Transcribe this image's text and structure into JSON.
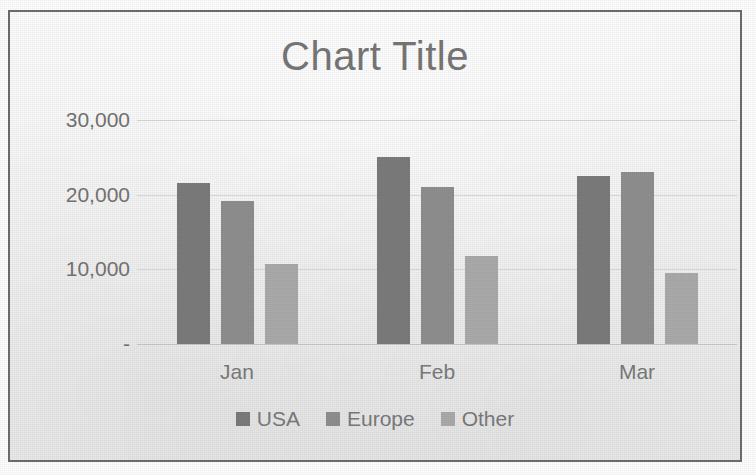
{
  "chart_data": {
    "type": "bar",
    "title": "Chart Title",
    "xlabel": "",
    "ylabel": "",
    "categories": [
      "Jan",
      "Feb",
      "Mar"
    ],
    "series": [
      {
        "name": "USA",
        "values": [
          21500,
          25000,
          22500
        ],
        "color": "#7b7b7b"
      },
      {
        "name": "Europe",
        "values": [
          19200,
          21000,
          23100
        ],
        "color": "#8e8e8e"
      },
      {
        "name": "Other",
        "values": [
          10700,
          11800,
          9500
        ],
        "color": "#aaaaaa"
      }
    ],
    "ylim": [
      0,
      30000
    ],
    "ytick_values": [
      30000,
      20000,
      10000,
      0
    ],
    "ytick_labels": [
      "30,000",
      "20,000",
      "10,000",
      "-"
    ],
    "grid": true,
    "legend_position": "bottom",
    "grouping": "clustered"
  },
  "chart": {
    "title": "Chart Title",
    "y_axis": {
      "ticks": [
        {
          "label": "30,000",
          "value": 30000
        },
        {
          "label": "20,000",
          "value": 20000
        },
        {
          "label": "10,000",
          "value": 10000
        },
        {
          "label": "-",
          "value": 0
        }
      ]
    },
    "x_axis": {
      "categories": [
        "Jan",
        "Feb",
        "Mar"
      ]
    },
    "legend": {
      "items": [
        {
          "label": "USA",
          "color": "#7b7b7b"
        },
        {
          "label": "Europe",
          "color": "#8e8e8e"
        },
        {
          "label": "Other",
          "color": "#aaaaaa"
        }
      ]
    }
  }
}
